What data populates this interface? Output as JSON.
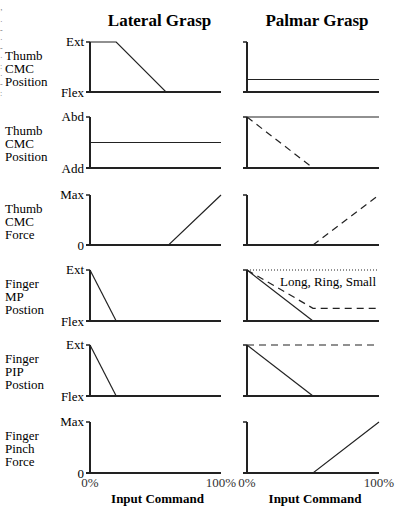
{
  "chart_data": {
    "type": "line",
    "layout": "small-multiples grid, 6 rows x 2 columns",
    "columns": [
      "Lateral Grasp",
      "Palmar Grasp"
    ],
    "x_axis": {
      "label": "Input Command",
      "ticks": [
        "0%",
        "100%"
      ],
      "range": [
        0,
        100
      ]
    },
    "rows": [
      {
        "label": [
          "Thumb",
          "CMC",
          "Position"
        ],
        "y_ticks": {
          "top": "Ext",
          "bottom": "Flex"
        },
        "panels": [
          {
            "series": [
              {
                "style": "solid",
                "points": [
                  [
                    0,
                    100
                  ],
                  [
                    20,
                    100
                  ],
                  [
                    58,
                    0
                  ],
                  [
                    100,
                    0
                  ]
                ]
              }
            ]
          },
          {
            "series": [
              {
                "style": "solid",
                "points": [
                  [
                    0,
                    25
                  ],
                  [
                    100,
                    25
                  ]
                ]
              }
            ]
          }
        ]
      },
      {
        "label": [
          "Thumb",
          "CMC",
          "Position"
        ],
        "y_ticks": {
          "top": "Abd",
          "bottom": "Add"
        },
        "panels": [
          {
            "series": [
              {
                "style": "solid",
                "points": [
                  [
                    0,
                    50
                  ],
                  [
                    100,
                    50
                  ]
                ]
              }
            ]
          },
          {
            "series": [
              {
                "style": "solid",
                "points": [
                  [
                    0,
                    100
                  ],
                  [
                    100,
                    100
                  ]
                ]
              },
              {
                "style": "dashed",
                "points": [
                  [
                    0,
                    100
                  ],
                  [
                    50,
                    0
                  ]
                ]
              }
            ]
          }
        ]
      },
      {
        "label": [
          "Thumb",
          "CMC",
          "Force"
        ],
        "y_ticks": {
          "top": "Max",
          "bottom": "0"
        },
        "panels": [
          {
            "series": [
              {
                "style": "solid",
                "points": [
                  [
                    0,
                    0
                  ],
                  [
                    60,
                    0
                  ],
                  [
                    100,
                    100
                  ]
                ]
              }
            ]
          },
          {
            "series": [
              {
                "style": "dashed",
                "points": [
                  [
                    50,
                    0
                  ],
                  [
                    100,
                    100
                  ]
                ]
              }
            ]
          }
        ]
      },
      {
        "label": [
          "Finger",
          "MP",
          "Postion"
        ],
        "y_ticks": {
          "top": "Ext",
          "bottom": "Flex"
        },
        "panels": [
          {
            "series": [
              {
                "style": "solid",
                "points": [
                  [
                    0,
                    100
                  ],
                  [
                    20,
                    0
                  ]
                ]
              }
            ]
          },
          {
            "series": [
              {
                "style": "dotted",
                "points": [
                  [
                    0,
                    100
                  ],
                  [
                    100,
                    100
                  ]
                ]
              },
              {
                "style": "solid",
                "points": [
                  [
                    0,
                    100
                  ],
                  [
                    50,
                    0
                  ]
                ]
              },
              {
                "style": "dashed",
                "points": [
                  [
                    0,
                    100
                  ],
                  [
                    50,
                    25
                  ],
                  [
                    100,
                    25
                  ]
                ]
              }
            ],
            "annotation": "Long, Ring, Small"
          }
        ]
      },
      {
        "label": [
          "Finger",
          "PIP",
          "Postion"
        ],
        "y_ticks": {
          "top": "Ext",
          "bottom": "Flex"
        },
        "panels": [
          {
            "series": [
              {
                "style": "solid",
                "points": [
                  [
                    0,
                    100
                  ],
                  [
                    20,
                    0
                  ]
                ]
              }
            ]
          },
          {
            "series": [
              {
                "style": "dashed",
                "points": [
                  [
                    0,
                    100
                  ],
                  [
                    100,
                    100
                  ]
                ]
              },
              {
                "style": "solid",
                "points": [
                  [
                    0,
                    100
                  ],
                  [
                    50,
                    0
                  ]
                ]
              }
            ]
          }
        ]
      },
      {
        "label": [
          "Finger",
          "Pinch",
          "Force"
        ],
        "y_ticks": {
          "top": "Max",
          "bottom": "0"
        },
        "panels": [
          {
            "series": []
          },
          {
            "series": [
              {
                "style": "solid",
                "points": [
                  [
                    0,
                    0
                  ],
                  [
                    50,
                    0
                  ],
                  [
                    100,
                    100
                  ]
                ]
              }
            ]
          }
        ]
      }
    ]
  },
  "geometry": {
    "col_x": [
      [
        90,
        221
      ],
      [
        247,
        379
      ]
    ],
    "row_y": [
      [
        42,
        92
      ],
      [
        117,
        168
      ],
      [
        195,
        245
      ],
      [
        270,
        321
      ],
      [
        345,
        396
      ],
      [
        422,
        473
      ]
    ],
    "title_y": 26
  }
}
